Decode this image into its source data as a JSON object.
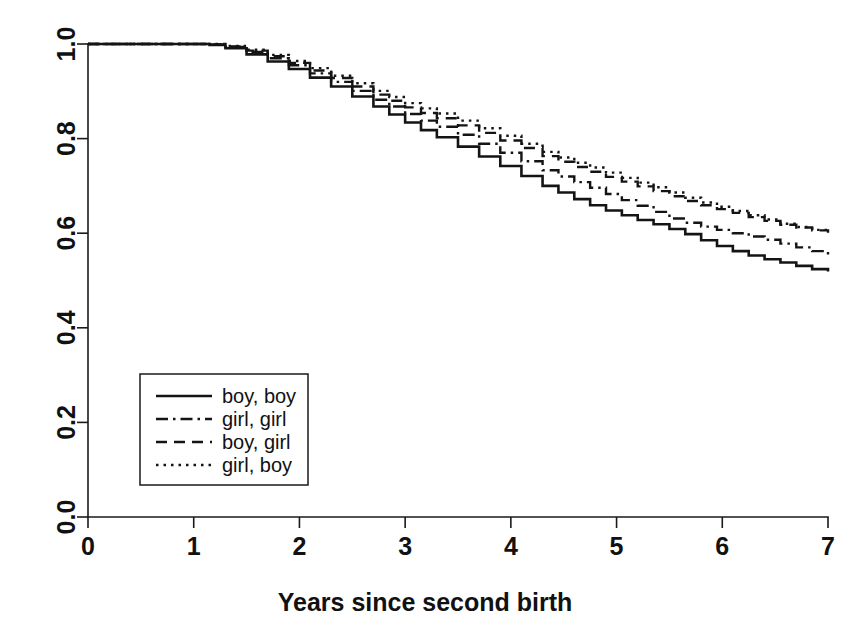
{
  "chart_data": {
    "type": "line",
    "title": "",
    "subtitle": "",
    "xlabel": "Years since second birth",
    "ylabel": "",
    "xlim": [
      0,
      7
    ],
    "ylim": [
      0.0,
      1.0
    ],
    "xticks": [
      "0",
      "1",
      "2",
      "3",
      "4",
      "5",
      "6",
      "7"
    ],
    "yticks": [
      "0.0",
      "0.2",
      "0.4",
      "0.6",
      "0.8",
      "1.0"
    ],
    "grid": false,
    "legend_position": "center-left",
    "legend_entries": [
      {
        "label": "boy, boy",
        "style": "solid"
      },
      {
        "label": "girl, girl",
        "style": "dashdot"
      },
      {
        "label": "boy, girl",
        "style": "dashed"
      },
      {
        "label": "girl, boy",
        "style": "dotted"
      }
    ],
    "series": [
      {
        "name": "boy, boy",
        "style": "solid",
        "x": [
          0.0,
          1.05,
          1.15,
          1.3,
          1.5,
          1.7,
          1.9,
          2.1,
          2.3,
          2.5,
          2.7,
          2.85,
          3.0,
          3.15,
          3.3,
          3.5,
          3.7,
          3.9,
          4.1,
          4.3,
          4.45,
          4.6,
          4.75,
          4.9,
          5.05,
          5.2,
          5.35,
          5.5,
          5.65,
          5.8,
          5.95,
          6.1,
          6.25,
          6.4,
          6.55,
          6.7,
          6.85,
          7.0
        ],
        "y": [
          1.0,
          1.0,
          0.998,
          0.991,
          0.978,
          0.963,
          0.947,
          0.929,
          0.91,
          0.889,
          0.868,
          0.851,
          0.834,
          0.818,
          0.803,
          0.783,
          0.762,
          0.742,
          0.721,
          0.7,
          0.686,
          0.672,
          0.659,
          0.648,
          0.638,
          0.628,
          0.619,
          0.609,
          0.598,
          0.585,
          0.573,
          0.562,
          0.553,
          0.545,
          0.538,
          0.531,
          0.524,
          0.519
        ]
      },
      {
        "name": "girl, girl",
        "style": "dashdot",
        "x": [
          0.0,
          1.05,
          1.15,
          1.3,
          1.5,
          1.7,
          1.9,
          2.1,
          2.3,
          2.5,
          2.7,
          2.85,
          3.0,
          3.15,
          3.3,
          3.5,
          3.7,
          3.9,
          4.1,
          4.3,
          4.45,
          4.6,
          4.75,
          4.9,
          5.05,
          5.2,
          5.35,
          5.5,
          5.65,
          5.8,
          5.95,
          6.1,
          6.25,
          6.4,
          6.55,
          6.7,
          6.85,
          7.0
        ],
        "y": [
          1.0,
          1.0,
          0.999,
          0.994,
          0.983,
          0.97,
          0.955,
          0.938,
          0.92,
          0.901,
          0.882,
          0.868,
          0.852,
          0.838,
          0.825,
          0.808,
          0.789,
          0.77,
          0.752,
          0.733,
          0.72,
          0.708,
          0.696,
          0.683,
          0.67,
          0.658,
          0.645,
          0.631,
          0.622,
          0.614,
          0.607,
          0.6,
          0.593,
          0.586,
          0.578,
          0.57,
          0.562,
          0.555
        ]
      },
      {
        "name": "boy, girl",
        "style": "dashed",
        "x": [
          0.0,
          1.05,
          1.15,
          1.3,
          1.5,
          1.7,
          1.9,
          2.1,
          2.3,
          2.5,
          2.7,
          2.85,
          3.0,
          3.15,
          3.3,
          3.5,
          3.7,
          3.9,
          4.1,
          4.3,
          4.45,
          4.6,
          4.75,
          4.9,
          5.05,
          5.2,
          5.35,
          5.5,
          5.65,
          5.8,
          5.95,
          6.1,
          6.25,
          6.4,
          6.55,
          6.7,
          6.85,
          7.0
        ],
        "y": [
          1.0,
          1.0,
          0.999,
          0.995,
          0.986,
          0.974,
          0.96,
          0.944,
          0.928,
          0.91,
          0.893,
          0.88,
          0.866,
          0.854,
          0.843,
          0.828,
          0.812,
          0.796,
          0.78,
          0.763,
          0.751,
          0.74,
          0.73,
          0.719,
          0.709,
          0.699,
          0.689,
          0.678,
          0.668,
          0.659,
          0.651,
          0.643,
          0.634,
          0.626,
          0.618,
          0.612,
          0.606,
          0.601
        ]
      },
      {
        "name": "girl, boy",
        "style": "dotted",
        "x": [
          0.0,
          1.05,
          1.15,
          1.3,
          1.5,
          1.7,
          1.9,
          2.1,
          2.3,
          2.5,
          2.7,
          2.85,
          3.0,
          3.15,
          3.3,
          3.5,
          3.7,
          3.9,
          4.1,
          4.3,
          4.45,
          4.6,
          4.75,
          4.9,
          5.05,
          5.2,
          5.35,
          5.5,
          5.65,
          5.8,
          5.95,
          6.1,
          6.25,
          6.4,
          6.55,
          6.7,
          6.85,
          7.0
        ],
        "y": [
          1.0,
          1.0,
          1.0,
          0.996,
          0.988,
          0.977,
          0.964,
          0.949,
          0.933,
          0.917,
          0.901,
          0.888,
          0.875,
          0.864,
          0.853,
          0.838,
          0.822,
          0.806,
          0.789,
          0.772,
          0.76,
          0.749,
          0.739,
          0.728,
          0.717,
          0.707,
          0.697,
          0.686,
          0.675,
          0.665,
          0.656,
          0.647,
          0.638,
          0.629,
          0.62,
          0.613,
          0.607,
          0.602
        ]
      }
    ]
  },
  "colors": {
    "background": "#ffffff",
    "foreground": "#141414",
    "axis": "#1a1a1a"
  }
}
